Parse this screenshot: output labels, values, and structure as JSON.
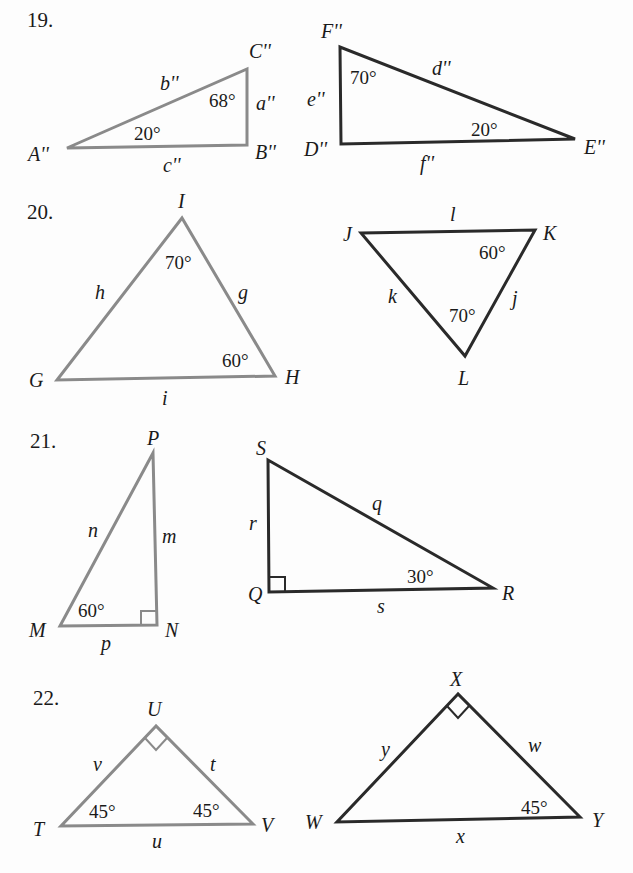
{
  "problems": [
    {
      "number": "19.",
      "triangles": [
        {
          "style": "gray",
          "vertices": {
            "A": "A''",
            "B": "B''",
            "C": "C''"
          },
          "sides": {
            "a": "a''",
            "b": "b''",
            "c": "c''"
          },
          "angles": {
            "A": "20°",
            "C": "68°"
          }
        },
        {
          "style": "dark",
          "vertices": {
            "D": "D''",
            "E": "E''",
            "F": "F''"
          },
          "sides": {
            "d": "d''",
            "e": "e''",
            "f": "f''"
          },
          "angles": {
            "F": "70°",
            "E": "20°"
          }
        }
      ]
    },
    {
      "number": "20.",
      "triangles": [
        {
          "style": "gray",
          "vertices": {
            "G": "G",
            "H": "H",
            "I": "I"
          },
          "sides": {
            "g": "g",
            "h": "h",
            "i": "i"
          },
          "angles": {
            "I": "70°",
            "H": "60°"
          }
        },
        {
          "style": "dark",
          "vertices": {
            "J": "J",
            "K": "K",
            "L": "L"
          },
          "sides": {
            "j": "j",
            "k": "k",
            "l": "l"
          },
          "angles": {
            "K": "60°",
            "L": "70°"
          }
        }
      ]
    },
    {
      "number": "21.",
      "triangles": [
        {
          "style": "gray",
          "vertices": {
            "M": "M",
            "N": "N",
            "P": "P"
          },
          "sides": {
            "m": "m",
            "n": "n",
            "p": "p"
          },
          "angles": {
            "M": "60°"
          },
          "right_angle_at": "N"
        },
        {
          "style": "dark",
          "vertices": {
            "Q": "Q",
            "R": "R",
            "S": "S"
          },
          "sides": {
            "q": "q",
            "r": "r",
            "s": "s"
          },
          "angles": {
            "R": "30°"
          },
          "right_angle_at": "Q"
        }
      ]
    },
    {
      "number": "22.",
      "triangles": [
        {
          "style": "gray",
          "vertices": {
            "T": "T",
            "U": "U",
            "V": "V"
          },
          "sides": {
            "t": "t",
            "u": "u",
            "v": "v"
          },
          "angles": {
            "T": "45°",
            "V": "45°"
          },
          "right_angle_at": "U"
        },
        {
          "style": "dark",
          "vertices": {
            "W": "W",
            "X": "X",
            "Y": "Y"
          },
          "sides": {
            "w": "w",
            "x": "x",
            "y": "y"
          },
          "angles": {
            "Y": "45°"
          },
          "right_angle_at": "X"
        }
      ]
    }
  ],
  "colors": {
    "gray_triangle": "#8a8a8a",
    "dark_triangle": "#2a2a2a",
    "text": "#1a1a1a",
    "background": "#fdfdfd"
  }
}
